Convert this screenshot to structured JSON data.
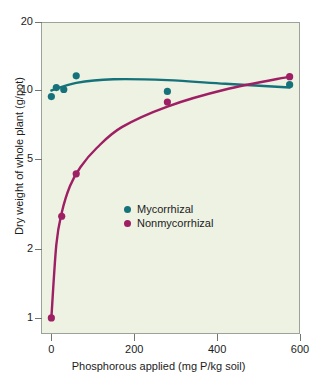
{
  "chart_data": {
    "type": "scatter",
    "title": "",
    "xlabel": "Phosphorous applied (mg P/kg soil)",
    "ylabel": "Dry weight of whole plant (g/pot)",
    "xlim": [
      -25,
      600
    ],
    "ylim": [
      0.85,
      20
    ],
    "yscale": "log",
    "xscale": "linear",
    "grid": false,
    "legend_position": "inside-center-left",
    "xticks": [
      "0",
      "200",
      "400",
      "600"
    ],
    "xtick_values": [
      0,
      200,
      400,
      600
    ],
    "yticks": [
      "1",
      "2",
      "5",
      "10",
      "20"
    ],
    "ytick_values": [
      1,
      2,
      5,
      10,
      20
    ],
    "series": [
      {
        "name": "Mycorrhizal",
        "color": "#16727a",
        "marker": "circle",
        "points": [
          {
            "x": 0,
            "y": 9.4
          },
          {
            "x": 12,
            "y": 10.3
          },
          {
            "x": 30,
            "y": 10.1
          },
          {
            "x": 60,
            "y": 11.6
          },
          {
            "x": 280,
            "y": 9.9
          },
          {
            "x": 575,
            "y": 10.6
          }
        ],
        "fit_curve": [
          {
            "x": 0,
            "y": 10.0
          },
          {
            "x": 60,
            "y": 10.8
          },
          {
            "x": 150,
            "y": 11.2
          },
          {
            "x": 280,
            "y": 11.1
          },
          {
            "x": 420,
            "y": 10.7
          },
          {
            "x": 575,
            "y": 10.3
          }
        ]
      },
      {
        "name": "Nonmycorrhizal",
        "color": "#9e1f63",
        "marker": "circle",
        "points": [
          {
            "x": 0,
            "y": 1.0
          },
          {
            "x": 25,
            "y": 2.8
          },
          {
            "x": 60,
            "y": 4.3
          },
          {
            "x": 280,
            "y": 8.9
          },
          {
            "x": 575,
            "y": 11.5
          }
        ],
        "fit_curve": [
          {
            "x": 0,
            "y": 1.0
          },
          {
            "x": 12,
            "y": 2.1
          },
          {
            "x": 25,
            "y": 2.9
          },
          {
            "x": 45,
            "y": 3.8
          },
          {
            "x": 70,
            "y": 4.6
          },
          {
            "x": 110,
            "y": 5.6
          },
          {
            "x": 170,
            "y": 6.9
          },
          {
            "x": 280,
            "y": 8.5
          },
          {
            "x": 420,
            "y": 10.1
          },
          {
            "x": 575,
            "y": 11.5
          }
        ]
      }
    ],
    "legend": [
      {
        "label": "Mycorrhizal",
        "color": "#16727a"
      },
      {
        "label": "Nonmycorrhizal",
        "color": "#9e1f63"
      }
    ],
    "colors": {
      "mycorrhizal": "#16727a",
      "nonmycorrhizal": "#9e1f63",
      "plot_background": "#edf2e3",
      "axis": "#6f776f",
      "text": "#1c1c1c"
    }
  }
}
